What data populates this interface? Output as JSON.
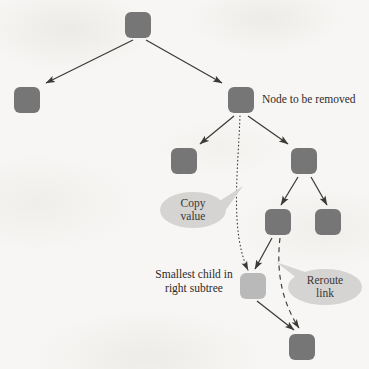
{
  "figure": {
    "kind": "binary-search-tree-node-removal-diagram",
    "background_color": "#f7f6f4",
    "node_color": "#767676",
    "node_highlight_color": "#b9b9b9",
    "callout_color": "#d5d4d2",
    "line_color": "#3c3a37",
    "text_color": "#2e2b28"
  },
  "labels": {
    "node_to_be_removed": "Node to be removed",
    "smallest_child_line1": "Smallest child in",
    "smallest_child_line2": "right subtree"
  },
  "callouts": {
    "copy_value_line1": "Copy",
    "copy_value_line2": "value",
    "reroute_link_line1": "Reroute",
    "reroute_link_line2": "link"
  },
  "nodes": [
    {
      "id": "root",
      "x": 125,
      "y": 12,
      "w": 26,
      "h": 26,
      "shade": "dark"
    },
    {
      "id": "left-child",
      "x": 14,
      "y": 87,
      "w": 26,
      "h": 26,
      "shade": "dark"
    },
    {
      "id": "removed",
      "x": 228,
      "y": 87,
      "w": 26,
      "h": 26,
      "shade": "dark"
    },
    {
      "id": "removed-left",
      "x": 171,
      "y": 148,
      "w": 26,
      "h": 26,
      "shade": "dark"
    },
    {
      "id": "removed-right",
      "x": 291,
      "y": 148,
      "w": 26,
      "h": 26,
      "shade": "dark"
    },
    {
      "id": "inner-left",
      "x": 265,
      "y": 209,
      "w": 26,
      "h": 26,
      "shade": "dark"
    },
    {
      "id": "inner-right",
      "x": 315,
      "y": 209,
      "w": 26,
      "h": 26,
      "shade": "dark"
    },
    {
      "id": "smallest-child",
      "x": 240,
      "y": 273,
      "w": 26,
      "h": 26,
      "shade": "light"
    },
    {
      "id": "bottom",
      "x": 289,
      "y": 334,
      "w": 26,
      "h": 26,
      "shade": "dark"
    }
  ],
  "edges": [
    {
      "id": "root-to-left-child",
      "style": "solid",
      "arrow": true
    },
    {
      "id": "root-to-removed",
      "style": "solid",
      "arrow": true
    },
    {
      "id": "removed-to-left",
      "style": "solid",
      "arrow": true
    },
    {
      "id": "removed-to-right",
      "style": "solid",
      "arrow": true
    },
    {
      "id": "right-to-inner-left",
      "style": "solid",
      "arrow": true
    },
    {
      "id": "right-to-inner-right",
      "style": "solid",
      "arrow": true
    },
    {
      "id": "inner-left-to-smallest",
      "style": "solid",
      "arrow": true
    },
    {
      "id": "smallest-to-bottom",
      "style": "solid",
      "arrow": true
    },
    {
      "id": "copy-value-dotted",
      "style": "dotted",
      "arrow": true
    },
    {
      "id": "reroute-link-dashed",
      "style": "dashed",
      "arrow": true
    }
  ]
}
